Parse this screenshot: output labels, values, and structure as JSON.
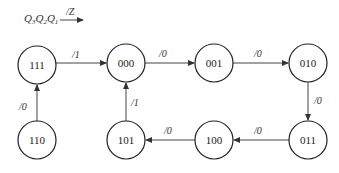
{
  "legend": {
    "state_vars": [
      "Q",
      "Q",
      "Q"
    ],
    "state_subs": [
      "3",
      "2",
      "1"
    ],
    "output_label": "/Z"
  },
  "states": [
    {
      "id": "s111",
      "label": "111",
      "cx": 37,
      "cy": 65
    },
    {
      "id": "s000",
      "label": "000",
      "cx": 126,
      "cy": 63
    },
    {
      "id": "s001",
      "label": "001",
      "cx": 214,
      "cy": 63
    },
    {
      "id": "s010",
      "label": "010",
      "cx": 308,
      "cy": 63
    },
    {
      "id": "s011",
      "label": "011",
      "cx": 308,
      "cy": 140
    },
    {
      "id": "s100",
      "label": "100",
      "cx": 214,
      "cy": 140
    },
    {
      "id": "s101",
      "label": "101",
      "cx": 126,
      "cy": 140
    },
    {
      "id": "s110",
      "label": "110",
      "cx": 37,
      "cy": 140
    }
  ],
  "transitions": [
    {
      "from": "111",
      "to": "000",
      "label": "/1"
    },
    {
      "from": "000",
      "to": "001",
      "label": "/0"
    },
    {
      "from": "001",
      "to": "010",
      "label": "/0"
    },
    {
      "from": "010",
      "to": "011",
      "label": "/0"
    },
    {
      "from": "011",
      "to": "100",
      "label": "/0"
    },
    {
      "from": "100",
      "to": "101",
      "label": "/0"
    },
    {
      "from": "101",
      "to": "000",
      "label": "/1"
    },
    {
      "from": "110",
      "to": "111",
      "label": "/0"
    }
  ],
  "colors": {
    "stroke": "#222222",
    "background": "#ffffff"
  }
}
